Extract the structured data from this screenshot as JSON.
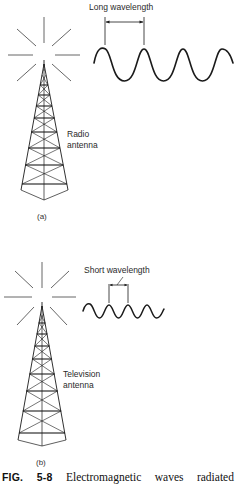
{
  "figure": {
    "panels": [
      {
        "id": "a",
        "panel_label": "(a)",
        "antenna_label_line1": "Radio",
        "antenna_label_line2": "antenna",
        "wavelength_label": "Long wavelength",
        "wave": {
          "type": "long",
          "cycles_visible": 3.5
        }
      },
      {
        "id": "b",
        "panel_label": "(b)",
        "antenna_label_line1": "Television",
        "antenna_label_line2": "antenna",
        "wavelength_label": "Short wavelength",
        "wave": {
          "type": "short",
          "cycles_visible": 4
        }
      }
    ],
    "caption": {
      "fig_word": "FIG.",
      "fig_number": "5-8",
      "word1": "Electromagnetic",
      "word2": "waves",
      "word3": "radiated"
    },
    "colors": {
      "ink": "#1a1a1a",
      "ray": "#555555",
      "background": "#ffffff"
    }
  }
}
